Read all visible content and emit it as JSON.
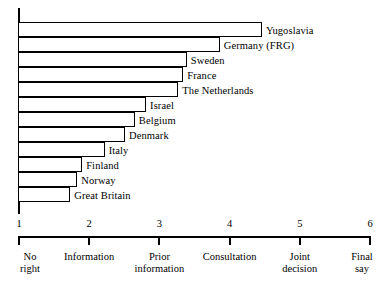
{
  "chart_data": {
    "type": "bar",
    "orientation": "horizontal",
    "title": "",
    "subtitle": "",
    "xlabel": "",
    "ylabel": "",
    "xlim": [
      1,
      6
    ],
    "grid": false,
    "legend": null,
    "categories": [
      "Yugoslavia",
      "Germany (FRG)",
      "Sweden",
      "France",
      "The Netherlands",
      "Israel",
      "Belgium",
      "Denmark",
      "Italy",
      "Finland",
      "Norway",
      "Great Britain"
    ],
    "values": [
      4.46,
      3.86,
      3.39,
      3.34,
      3.27,
      2.81,
      2.65,
      2.51,
      2.22,
      1.9,
      1.83,
      1.73
    ],
    "x_ticks": [
      {
        "value": 1,
        "label": "1",
        "caption_line1": "No",
        "caption_line2": "right"
      },
      {
        "value": 2,
        "label": "2",
        "caption_line1": "Information",
        "caption_line2": ""
      },
      {
        "value": 3,
        "label": "3",
        "caption_line1": "Prior",
        "caption_line2": "information"
      },
      {
        "value": 4,
        "label": "4",
        "caption_line1": "Consultation",
        "caption_line2": ""
      },
      {
        "value": 5,
        "label": "5",
        "caption_line1": "Joint",
        "caption_line2": "decision"
      },
      {
        "value": 6,
        "label": "6",
        "caption_line1": "Final",
        "caption_line2": "say"
      }
    ],
    "colors": {
      "bar_fill": "#ffffff",
      "bar_stroke": "#000000",
      "axis": "#000000",
      "text": "#000000",
      "background": "#ffffff"
    }
  }
}
